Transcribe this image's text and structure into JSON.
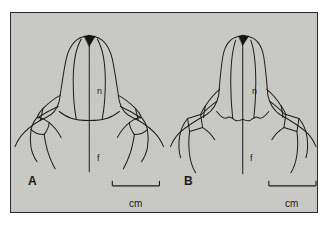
{
  "figure": {
    "background_color": "#ffffff",
    "panel_color": "#c9c9c6",
    "frame_color": "#2b2b2b",
    "ink_color": "#1c1c1c",
    "type": "line-drawing"
  },
  "panels": [
    {
      "id": "A",
      "label": "A",
      "anatomy_labels": [
        {
          "key": "nasal",
          "text": "n"
        },
        {
          "key": "frontal",
          "text": "f"
        }
      ],
      "scale_bar": {
        "caption": "cm",
        "units": "cm"
      },
      "apex_marking": "solid-black-triangle"
    },
    {
      "id": "B",
      "label": "B",
      "anatomy_labels": [
        {
          "key": "nasal",
          "text": "n"
        },
        {
          "key": "frontal",
          "text": "f"
        }
      ],
      "scale_bar": {
        "caption": "cm",
        "units": "cm"
      },
      "apex_marking": "solid-black-triangle"
    }
  ]
}
